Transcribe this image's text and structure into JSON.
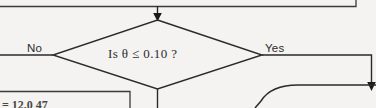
{
  "diagram": {
    "type": "flowchart",
    "title": "",
    "background_color": "#f4f3f1",
    "line_color": "#262626",
    "text_color": "#2b2b2b",
    "decision": {
      "shape": "diamond",
      "text": "Is θ ≤ 0.10 ?",
      "branches": {
        "no_label": "No",
        "yes_label": "Yes"
      }
    },
    "top_box": {
      "shape": "rectangle",
      "text": ""
    },
    "lower_left_box": {
      "shape": "rectangle",
      "text": "= 12.0  47"
    },
    "lower_right_shape": {
      "shape": "rounded-rectangle",
      "text": ""
    },
    "connectors": [
      {
        "name": "top-box-to-decision",
        "direction": "down",
        "arrowhead": true
      },
      {
        "name": "decision-no-branch",
        "direction": "left",
        "arrowhead": false
      },
      {
        "name": "decision-yes-branch",
        "direction": "right-then-down",
        "arrowhead": true
      },
      {
        "name": "decision-bottom-to-lower-box",
        "direction": "down",
        "arrowhead": false
      },
      {
        "name": "lower-right-into-shape",
        "direction": "down",
        "arrowhead": true
      }
    ]
  }
}
